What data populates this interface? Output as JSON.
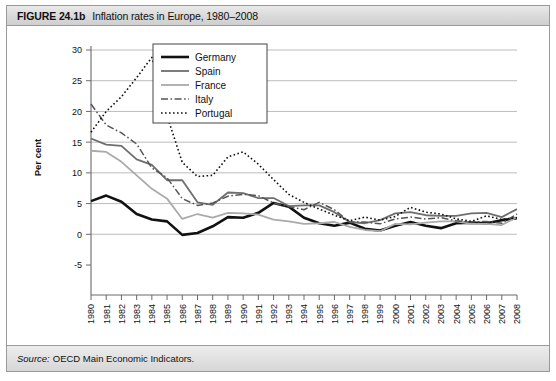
{
  "figure": {
    "number": "FIGURE 24.1b",
    "title": "Inflation rates in Europe, 1980–2008",
    "source_label": "Source:",
    "source_text": "OECD Main Economic Indicators."
  },
  "chart_data": {
    "type": "line",
    "title": "Inflation rates in Europe, 1980–2008",
    "xlabel": "Year",
    "ylabel": "Per cent",
    "xlim": [
      1980,
      2008
    ],
    "ylim": [
      -5,
      30
    ],
    "yticks": [
      -5,
      0,
      5,
      10,
      15,
      20,
      25,
      30
    ],
    "grid": true,
    "legend_position": "top-center",
    "x": [
      1980,
      1981,
      1982,
      1983,
      1984,
      1985,
      1986,
      1987,
      1988,
      1989,
      1990,
      1991,
      1992,
      1993,
      1994,
      1995,
      1996,
      1997,
      1998,
      1999,
      2000,
      2001,
      2002,
      2003,
      2004,
      2005,
      2006,
      2007,
      2008
    ],
    "categories": [
      "1980",
      "1981",
      "1982",
      "1983",
      "1984",
      "1985",
      "1986",
      "1987",
      "1988",
      "1989",
      "1990",
      "1991",
      "1992",
      "1993",
      "1994",
      "1995",
      "1996",
      "1997",
      "1998",
      "1999",
      "2000",
      "2001",
      "2002",
      "2003",
      "2004",
      "2005",
      "2006",
      "2007",
      "2008"
    ],
    "series": [
      {
        "name": "Germany",
        "color": "#111111",
        "width": 2.6,
        "dash": "none",
        "values": [
          5.4,
          6.3,
          5.3,
          3.3,
          2.4,
          2.1,
          -0.1,
          0.2,
          1.3,
          2.8,
          2.7,
          3.5,
          5.1,
          4.5,
          2.7,
          1.8,
          1.4,
          1.9,
          0.9,
          0.6,
          1.4,
          2.0,
          1.4,
          1.0,
          1.8,
          1.9,
          1.8,
          2.3,
          2.6
        ]
      },
      {
        "name": "Spain",
        "color": "#6e6e6e",
        "width": 1.8,
        "dash": "none",
        "values": [
          15.6,
          14.6,
          14.4,
          12.2,
          11.3,
          8.8,
          8.8,
          5.2,
          4.8,
          6.8,
          6.7,
          5.9,
          5.9,
          4.6,
          4.7,
          4.7,
          3.6,
          2.0,
          1.8,
          2.3,
          3.4,
          3.6,
          3.1,
          3.0,
          3.0,
          3.4,
          3.5,
          2.8,
          4.1
        ]
      },
      {
        "name": "France",
        "color": "#aaaaaa",
        "width": 1.8,
        "dash": "none",
        "values": [
          13.6,
          13.4,
          11.8,
          9.6,
          7.4,
          5.8,
          2.5,
          3.3,
          2.7,
          3.5,
          3.4,
          3.2,
          2.4,
          2.1,
          1.7,
          1.8,
          2.0,
          1.2,
          0.7,
          0.5,
          1.7,
          1.6,
          1.9,
          2.1,
          2.1,
          1.7,
          1.7,
          1.5,
          2.8
        ]
      },
      {
        "name": "Italy",
        "color": "#555555",
        "width": 1.5,
        "dash": "7,2.5,1.6,2.5",
        "values": [
          21.2,
          17.8,
          16.5,
          14.7,
          10.8,
          9.2,
          5.8,
          4.7,
          5.1,
          6.2,
          6.5,
          6.3,
          5.1,
          4.5,
          4.0,
          5.2,
          4.0,
          2.0,
          2.0,
          1.7,
          2.5,
          2.8,
          2.5,
          2.7,
          2.2,
          2.0,
          2.1,
          1.8,
          3.3
        ]
      },
      {
        "name": "Portugal",
        "color": "#111111",
        "width": 1.6,
        "dash": "1.6,2.4",
        "values": [
          16.6,
          20.0,
          22.4,
          25.5,
          28.8,
          19.3,
          11.7,
          9.4,
          9.6,
          12.6,
          13.4,
          11.4,
          8.9,
          6.5,
          5.2,
          4.1,
          3.1,
          2.2,
          2.8,
          2.3,
          2.9,
          4.4,
          3.6,
          3.3,
          2.5,
          2.1,
          3.0,
          2.4,
          2.7
        ]
      }
    ]
  },
  "legend": {
    "items": [
      "Germany",
      "Spain",
      "France",
      "Italy",
      "Portugal"
    ]
  }
}
